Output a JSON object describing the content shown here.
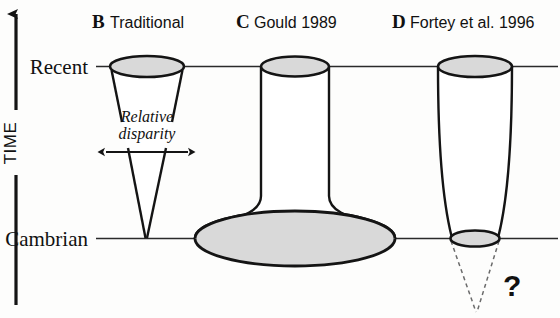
{
  "figure": {
    "title_axis": "TIME",
    "axis_direction_icon": "up-arrow-icon"
  },
  "era_labels": {
    "recent": "Recent",
    "cambrian": "Cambrian"
  },
  "panels": [
    {
      "letter": "B",
      "title": "Traditional",
      "shape": "cone-narrowing-downward",
      "annotation_line1": "Relative",
      "annotation_line2": "disparity",
      "annotation_icon": "double-headed-arrow-icon"
    },
    {
      "letter": "C",
      "title": "Gould 1989",
      "shape": "narrow-cylinder-on-wide-flared-base"
    },
    {
      "letter": "D",
      "title": "Fortey et al. 1996",
      "shape": "cylinder-tapering-slightly-downward",
      "uncertainty_marker": "?",
      "uncertainty_icon": "dashed-cone-icon"
    }
  ],
  "colors": {
    "fill_gray": "#d9d9d9",
    "outline": "#141414",
    "line": "#2a2a2a",
    "text": "#111111",
    "background": "#fdfdfc"
  }
}
